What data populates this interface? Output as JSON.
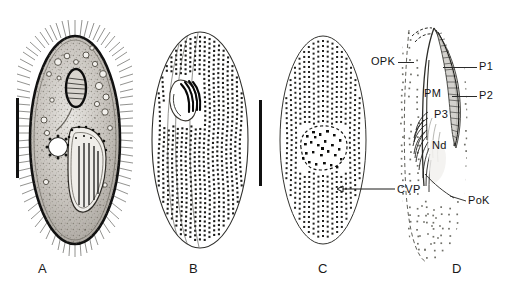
{
  "figure": {
    "background_color": "#ffffff",
    "ink_color": "#111111",
    "panel_count": 4
  },
  "panels": [
    {
      "letter": "A",
      "view": "life-cycle micrograph, lateral view of whole cell",
      "has_scalebar": true
    },
    {
      "letter": "B",
      "view": "ventral infraciliature, kinety rows and oral apparatus",
      "has_scalebar": true
    },
    {
      "letter": "C",
      "view": "dorsal infraciliature with contractile vacuole pore",
      "has_scalebar": false
    },
    {
      "letter": "D",
      "view": "detail of oral apparatus polykinetids",
      "has_scalebar": false
    }
  ],
  "labels": {
    "cvp": "CVP",
    "opk": "OPK",
    "p1": "P1",
    "p2": "P2",
    "p3": "P3",
    "pm": "PM",
    "nd": "Nd",
    "pok": "PoK"
  }
}
